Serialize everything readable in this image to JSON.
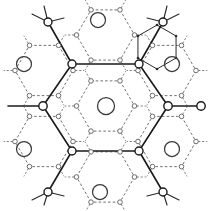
{
  "figure": {
    "canvas_width": 211,
    "canvas_height": 211,
    "background_color": "#ffffff",
    "caption": ""
  },
  "legend": {
    "solid_bond_label": "solid bond",
    "dashed_bond_label": "dashed bond",
    "vertex_label": "vertex node",
    "void_label": "open circle"
  },
  "style": {
    "solid_stroke": "#1a1a1a",
    "dashed_stroke": "#5a5a5a",
    "node_fill": "#ffffff",
    "void_stroke": "#3a3a3a"
  },
  "chart_data": {
    "type": "diagram",
    "central_hexagon": {
      "center": [
        105.5,
        106
      ],
      "circumradius": 42,
      "orientation": "pointy-side-horizontal",
      "vertices": [
        [
          72.0,
          64.0
        ],
        [
          139.0,
          64.0
        ],
        [
          168.0,
          106.0
        ],
        [
          139.0,
          151.0
        ],
        [
          72.0,
          151.0
        ],
        [
          43.0,
          106.0
        ]
      ]
    },
    "center_void": {
      "center": [
        106,
        106
      ],
      "radius": 8.5
    },
    "vertex_nodes": [
      {
        "cx": 72.0,
        "cy": 64.0,
        "r": 4.0
      },
      {
        "cx": 139.0,
        "cy": 64.0,
        "r": 4.0
      },
      {
        "cx": 168.0,
        "cy": 106.0,
        "r": 4.2
      },
      {
        "cx": 139.0,
        "cy": 151.0,
        "r": 4.0
      },
      {
        "cx": 72.0,
        "cy": 151.0,
        "r": 4.0
      },
      {
        "cx": 43.0,
        "cy": 106.0,
        "r": 4.2
      }
    ],
    "outer_solid_arms": [
      {
        "from": [
          72.0,
          64.0
        ],
        "to": [
          48.0,
          22.0
        ]
      },
      {
        "from": [
          139.0,
          64.0
        ],
        "to": [
          163.0,
          22.0
        ]
      },
      {
        "from": [
          168.0,
          106.0
        ],
        "to": [
          201.0,
          106.0
        ]
      },
      {
        "from": [
          139.0,
          151.0
        ],
        "to": [
          163.0,
          192.0
        ]
      },
      {
        "from": [
          72.0,
          151.0
        ],
        "to": [
          48.0,
          192.0
        ]
      },
      {
        "from": [
          43.0,
          106.0
        ],
        "to": [
          8.0,
          106.0
        ]
      }
    ],
    "terminal_branches": [
      {
        "node": [
          48.0,
          22.0
        ],
        "r": 4.0,
        "tips": [
          [
            32.0,
            14.0
          ],
          [
            64.0,
            18.0
          ],
          [
            44.0,
            6.0
          ]
        ]
      },
      {
        "node": [
          163.0,
          22.0
        ],
        "r": 4.0,
        "tips": [
          [
            179.0,
            14.0
          ],
          [
            147.0,
            18.0
          ],
          [
            167.0,
            6.0
          ]
        ]
      },
      {
        "node": [
          48.0,
          192.0
        ],
        "r": 4.0,
        "tips": [
          [
            32.0,
            200.0
          ],
          [
            64.0,
            196.0
          ],
          [
            44.0,
            205.0
          ]
        ]
      },
      {
        "node": [
          163.0,
          192.0
        ],
        "r": 4.0,
        "tips": [
          [
            179.0,
            200.0
          ],
          [
            147.0,
            196.0
          ],
          [
            167.0,
            205.0
          ]
        ]
      },
      {
        "node": [
          201.0,
          106.0
        ],
        "r": 4.2,
        "tips": []
      },
      {
        "node": [
          8.0,
          106.0
        ],
        "r": 0.0,
        "tips": []
      }
    ],
    "void_circles": [
      {
        "cx": 106,
        "cy": 106,
        "r": 8.5,
        "position": "center"
      },
      {
        "cx": 98,
        "cy": 20,
        "r": 7.5,
        "position": "top-center"
      },
      {
        "cx": 24,
        "cy": 64,
        "r": 7.5,
        "position": "left-upper"
      },
      {
        "cx": 172,
        "cy": 64,
        "r": 7.5,
        "position": "right-upper"
      },
      {
        "cx": 24,
        "cy": 149,
        "r": 7.5,
        "position": "left-lower"
      },
      {
        "cx": 172,
        "cy": 149,
        "r": 7.5,
        "position": "right-lower"
      },
      {
        "cx": 100,
        "cy": 192,
        "r": 7.5,
        "position": "bottom-center"
      }
    ],
    "dashed_hexagons": [
      {
        "center": [
          105.5,
          106
        ],
        "circumradius": 29,
        "label": "inner-dashed-ring"
      },
      {
        "center": [
          105.5,
          35
        ],
        "circumradius": 29,
        "label": "top-dashed-ring"
      },
      {
        "center": [
          105.5,
          177
        ],
        "circumradius": 29,
        "label": "bottom-dashed-ring"
      },
      {
        "center": [
          44.0,
          70.5
        ],
        "circumradius": 29,
        "label": "upper-left-dashed-ring"
      },
      {
        "center": [
          167.0,
          70.5
        ],
        "circumradius": 29,
        "label": "upper-right-dashed-ring"
      },
      {
        "center": [
          44.0,
          141.5
        ],
        "circumradius": 29,
        "label": "lower-left-dashed-ring"
      },
      {
        "center": [
          167.0,
          141.5
        ],
        "circumradius": 29,
        "label": "lower-right-dashed-ring"
      }
    ],
    "mini_hexagon": {
      "center": [
        157,
        47
      ],
      "circumradius": 22,
      "label": "overlay-hexagon-upper-right",
      "dot_radius": 1.3
    },
    "small_node_radius": 2.3
  }
}
